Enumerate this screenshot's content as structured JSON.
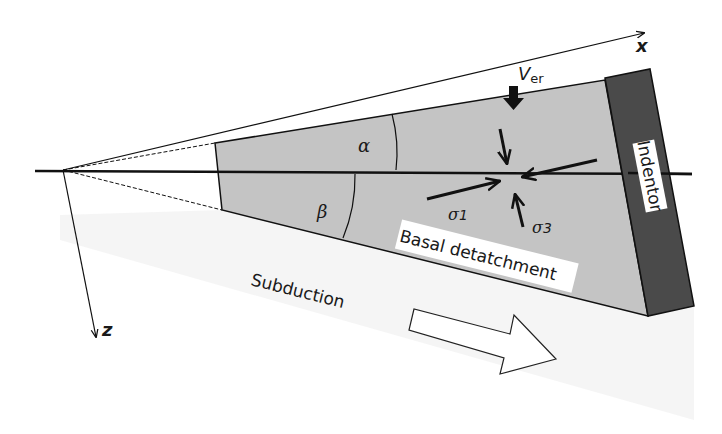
{
  "diagram": {
    "axes": {
      "x_label": "x",
      "z_label": "z"
    },
    "angles": {
      "alpha": "α",
      "beta": "β"
    },
    "labels": {
      "erosion_velocity_main": "V",
      "erosion_velocity_sub": "er",
      "sigma1": "σ1",
      "sigma3": "σ3",
      "indentor": "Indentor",
      "basal": "Basal detatchment",
      "subduction": "Subduction"
    },
    "colors": {
      "wedge_fill": "#c4c4c4",
      "indentor_fill": "#4a4a4a",
      "line": "#111111",
      "shadow": "#f1f1f1"
    }
  }
}
